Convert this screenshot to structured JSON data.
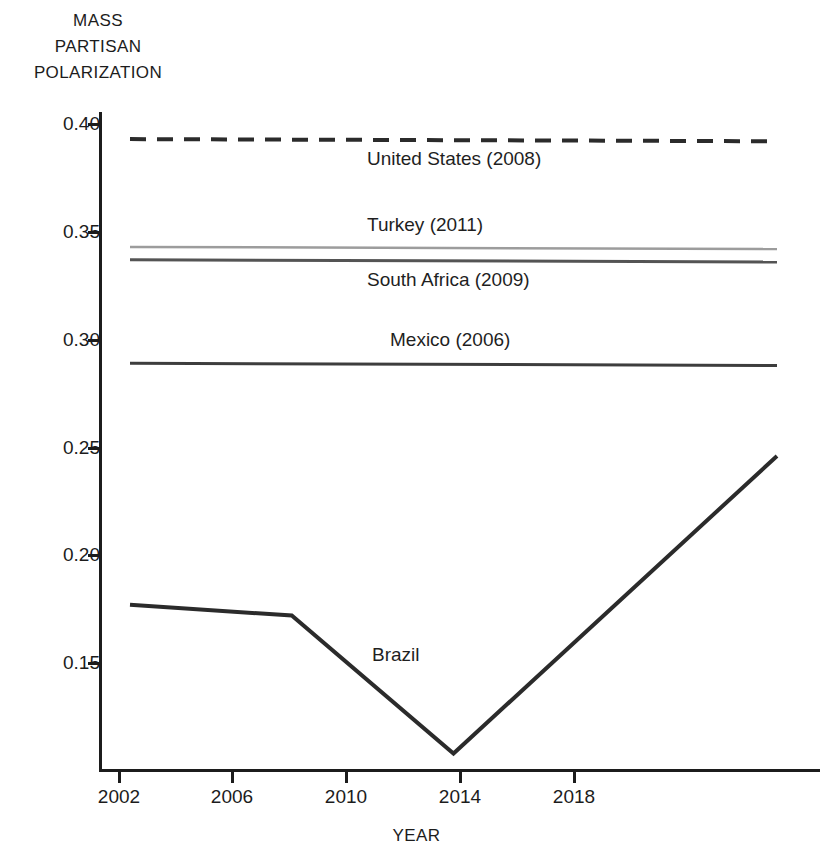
{
  "chart_data": {
    "type": "line",
    "title": "",
    "subtitle": "",
    "xlabel": "YEAR",
    "ylabel": "MASS PARTISAN POLARIZATION",
    "ylabel_lines": [
      "MASS",
      "PARTISAN",
      "POLARIZATION"
    ],
    "xlim": [
      2001,
      2019
    ],
    "ylim": [
      0.1,
      0.41
    ],
    "grid": false,
    "legend": "inline-labels",
    "x_ticks": [
      2002,
      2006,
      2010,
      2014,
      2018
    ],
    "x_tick_labels": [
      "2002",
      "2006",
      "2010",
      "2014",
      "2018"
    ],
    "y_ticks": [
      0.15,
      0.2,
      0.25,
      0.3,
      0.35,
      0.4
    ],
    "y_tick_labels": [
      "0.15",
      "0.20",
      "0.25",
      "0.30",
      "0.35",
      "0.40"
    ],
    "series": [
      {
        "name": "United States (2008)",
        "label": "United States (2008)",
        "style": "dashed",
        "color": "#2b2b2b",
        "width": 4,
        "x": [
          2002,
          2018
        ],
        "values": [
          0.393,
          0.392
        ]
      },
      {
        "name": "Turkey (2011)",
        "label": "Turkey (2011)",
        "style": "solid",
        "color": "#9c9c9c",
        "width": 2.5,
        "x": [
          2002,
          2018
        ],
        "values": [
          0.343,
          0.342
        ]
      },
      {
        "name": "South Africa (2009)",
        "label": "South Africa (2009)",
        "style": "solid",
        "color": "#545454",
        "width": 3,
        "x": [
          2002,
          2018
        ],
        "values": [
          0.337,
          0.336
        ]
      },
      {
        "name": "Mexico (2006)",
        "label": "Mexico (2006)",
        "style": "solid",
        "color": "#3d3d3d",
        "width": 3,
        "x": [
          2002,
          2018
        ],
        "values": [
          0.289,
          0.288
        ]
      },
      {
        "name": "Brazil",
        "label": "Brazil",
        "style": "solid",
        "color": "#2b2b2b",
        "width": 4,
        "x": [
          2002,
          2006,
          2010,
          2018
        ],
        "values": [
          0.177,
          0.172,
          0.108,
          0.246
        ]
      }
    ]
  },
  "axis": {
    "y_title_line_1": "MASS",
    "y_title_line_2": "PARTISAN",
    "y_title_line_3": "POLARIZATION",
    "x_title": "YEAR",
    "y_tick_0": "0.40",
    "y_tick_1": "0.35",
    "y_tick_2": "0.30",
    "y_tick_3": "0.25",
    "y_tick_4": "0.20",
    "y_tick_5": "0.15",
    "x_tick_0": "2002",
    "x_tick_1": "2006",
    "x_tick_2": "2010",
    "x_tick_3": "2014",
    "x_tick_4": "2018"
  },
  "labels": {
    "united_states": "United States (2008)",
    "turkey": "Turkey (2011)",
    "south_africa": "South Africa (2009)",
    "mexico": "Mexico (2006)",
    "brazil": "Brazil"
  },
  "colors": {
    "axis": "#1c1c1c",
    "united_states": "#2b2b2b",
    "turkey": "#9c9c9c",
    "south_africa": "#545454",
    "mexico": "#3d3d3d",
    "brazil": "#2b2b2b",
    "background": "#ffffff"
  }
}
